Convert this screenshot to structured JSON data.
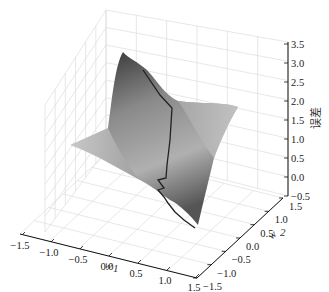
{
  "chart_data": {
    "type": "surface3d",
    "title": "",
    "xlabel": "w1",
    "ylabel": "w2",
    "zlabel": "误差",
    "x_ticks": [
      "−1.5",
      "−1.0",
      "−0.5",
      "0.0",
      "0.5",
      "1.0",
      "1.5"
    ],
    "y_ticks": [
      "−1.5",
      "−1.0",
      "−0.5",
      "0.0",
      "0.5",
      "1.0",
      "1.5"
    ],
    "z_ticks": [
      "−0.5",
      "0.0",
      "0.5",
      "1.0",
      "1.5",
      "2.0",
      "2.5",
      "3.0",
      "3.5"
    ],
    "xlim": [
      -1.5,
      1.5
    ],
    "ylim": [
      -1.5,
      1.5
    ],
    "zlim": [
      -0.5,
      3.5
    ],
    "grid": true,
    "colormap": "gray",
    "surface_description": "Error surface over weights w1,w2: high ridge near w1≈-1.5, falling saddle-like toward w1≈1.5 with a flat shelf on the right side",
    "path": {
      "name": "gradient descent trajectory",
      "color": "#222222",
      "points_approx": [
        {
          "w1": -0.6,
          "w2": 1.2,
          "z": 3.0
        },
        {
          "w1": -0.1,
          "w2": 0.6,
          "z": 2.4
        },
        {
          "w1": 0.1,
          "w2": 0.1,
          "z": 1.6
        },
        {
          "w1": 0.3,
          "w2": -0.3,
          "z": 0.9
        },
        {
          "w1": 0.5,
          "w2": -0.6,
          "z": 0.6
        },
        {
          "w1": 0.7,
          "w2": -0.9,
          "z": 0.3
        },
        {
          "w1": 1.0,
          "w2": -1.3,
          "z": 0.0
        }
      ]
    }
  }
}
